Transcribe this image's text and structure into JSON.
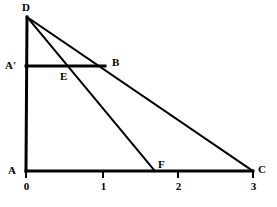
{
  "figure": {
    "width": 277,
    "height": 207,
    "background_color": "#ffffff",
    "stroke_color": "#000000"
  },
  "points": [
    {
      "name": "D",
      "label": "D",
      "x": 27,
      "y": 17,
      "label_x": 22,
      "label_y": 2
    },
    {
      "name": "A",
      "label": "A",
      "x": 26,
      "y": 171,
      "label_x": 8,
      "label_y": 165
    },
    {
      "name": "Ap",
      "label": "A'",
      "x": 26,
      "y": 66,
      "label_x": 5,
      "label_y": 60
    },
    {
      "name": "B",
      "label": "B",
      "x": 105,
      "y": 66,
      "label_x": 112,
      "label_y": 57
    },
    {
      "name": "E",
      "label": "E",
      "x": 64,
      "y": 66,
      "label_x": 60,
      "label_y": 71
    },
    {
      "name": "F",
      "label": "F",
      "x": 155,
      "y": 171,
      "label_x": 158,
      "label_y": 159
    },
    {
      "name": "C",
      "label": "C",
      "x": 253,
      "y": 171,
      "label_x": 258,
      "label_y": 164
    }
  ],
  "segments": [
    {
      "name": "vertical-axis-AD",
      "x1": 26,
      "y1": 171,
      "x2": 27,
      "y2": 17,
      "width": 3
    },
    {
      "name": "horizontal-axis-AC",
      "x1": 26,
      "y1": 171,
      "x2": 253,
      "y2": 171,
      "width": 3
    },
    {
      "name": "segment-A-prime-B",
      "x1": 26,
      "y1": 66,
      "x2": 105,
      "y2": 66,
      "width": 3
    },
    {
      "name": "line-D-C",
      "x1": 27,
      "y1": 17,
      "x2": 253,
      "y2": 171,
      "width": 2
    },
    {
      "name": "line-D-F",
      "x1": 27,
      "y1": 17,
      "x2": 155,
      "y2": 171,
      "width": 2
    }
  ],
  "axis": {
    "ticks": [
      {
        "label": "0",
        "x": 26,
        "label_x": 22,
        "label_y": 181
      },
      {
        "label": "1",
        "x": 103,
        "label_x": 99,
        "label_y": 181
      },
      {
        "label": "2",
        "x": 178,
        "label_x": 174,
        "label_y": 181
      },
      {
        "label": "3",
        "x": 253,
        "label_x": 249,
        "label_y": 181
      }
    ],
    "tick_length": 6,
    "tick_width": 2,
    "baseline_y": 171
  },
  "chart_data": {
    "type": "line",
    "title": "",
    "xlabel": "",
    "ylabel": "",
    "xlim": [
      0,
      3
    ],
    "grid": false,
    "legend": "none",
    "xticks": [
      0,
      1,
      2,
      3
    ],
    "xticklabels": [
      "0",
      "1",
      "2",
      "3"
    ],
    "annotations": [
      "D",
      "A'",
      "B",
      "E",
      "A",
      "F",
      "C"
    ],
    "series": [
      {
        "name": "line-D-C",
        "x": [
          0,
          3
        ],
        "y": [
          2.0,
          0.0
        ]
      },
      {
        "name": "line-D-F",
        "x": [
          0,
          1.7
        ],
        "y": [
          2.0,
          0.0
        ]
      },
      {
        "name": "segment-A-prime-B",
        "x": [
          0,
          1.04
        ],
        "y": [
          1.36,
          1.36
        ]
      },
      {
        "name": "vertical-axis-AD",
        "x": [
          0,
          0
        ],
        "y": [
          0.0,
          2.0
        ]
      },
      {
        "name": "horizontal-axis-AC",
        "x": [
          0,
          3
        ],
        "y": [
          0.0,
          0.0
        ]
      }
    ]
  }
}
